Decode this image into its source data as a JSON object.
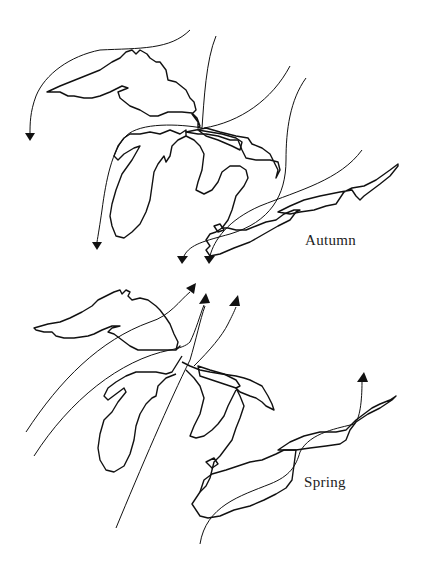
{
  "figure": {
    "top_cutoff_text": "migration routes shown for spring and autumn",
    "maps": [
      {
        "id": "autumn",
        "label": "Autumn"
      },
      {
        "id": "spring",
        "label": "Spring"
      }
    ]
  },
  "colors": {
    "ink": "#111111",
    "background": "#ffffff"
  }
}
